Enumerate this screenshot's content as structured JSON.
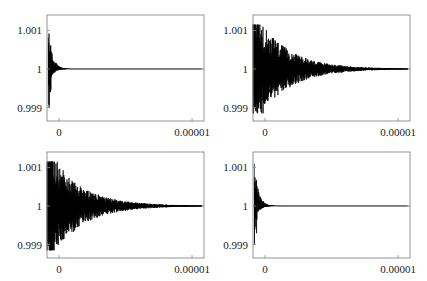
{
  "chart_data": [
    {
      "type": "line",
      "panel": "top-left",
      "title": "",
      "xlabel": "",
      "ylabel": "",
      "x_ticks": [
        "0",
        "0.00001"
      ],
      "y_ticks": [
        "1.001",
        "1",
        "0.999"
      ],
      "xlim": [
        0,
        1.18e-05
      ],
      "ylim": [
        0.99865,
        1.0014
      ],
      "reference_line": 1,
      "description": "Damped oscillation around 1; sharp spike to ~1.00115 near x=0, quickly decaying to 1 by ~0.000001",
      "envelope": {
        "initial_amplitude": 0.00115,
        "decay_x": 3e-07,
        "onset_x": 1e-07
      }
    },
    {
      "type": "line",
      "panel": "top-right",
      "title": "",
      "xlabel": "",
      "ylabel": "",
      "x_ticks": [
        "0",
        "0.00001"
      ],
      "y_ticks": [
        "1.001",
        "1",
        "0.999"
      ],
      "xlim": [
        0,
        1.18e-05
      ],
      "ylim": [
        0.99865,
        1.0014
      ],
      "reference_line": 1,
      "description": "Strongly oscillating signal clipped at ~1.00115 and ~0.99885 for x<0.000001, slowly decaying toward 1 by ~0.000011",
      "envelope": {
        "initial_amplitude": 0.0016,
        "decay_x": 2.2e-06,
        "onset_x": 0.0,
        "clip": [
          0.99885,
          1.00115
        ]
      }
    },
    {
      "type": "line",
      "panel": "bottom-left",
      "title": "",
      "xlabel": "",
      "ylabel": "",
      "x_ticks": [
        "0",
        "0.00001"
      ],
      "y_ticks": [
        "1.001",
        "1",
        "0.999"
      ],
      "xlim": [
        0,
        1.18e-05
      ],
      "ylim": [
        0.99865,
        1.0014
      ],
      "reference_line": 1,
      "description": "Strongly oscillating signal clipped at ~1.00115 and ~0.99885 for x<0.000001, slowly decaying toward 1 by ~0.000011",
      "envelope": {
        "initial_amplitude": 0.0016,
        "decay_x": 2.2e-06,
        "onset_x": 0.0,
        "clip": [
          0.99885,
          1.00115
        ]
      }
    },
    {
      "type": "line",
      "panel": "bottom-right",
      "title": "",
      "xlabel": "",
      "ylabel": "",
      "x_ticks": [
        "0",
        "0.00001"
      ],
      "y_ticks": [
        "1.001",
        "1",
        "0.999"
      ],
      "xlim": [
        0,
        1.18e-05
      ],
      "ylim": [
        0.99865,
        1.0014
      ],
      "reference_line": 1,
      "description": "Damped oscillation around 1; sharp spike to ~1.00115 near x=0, quickly decaying to 1 by ~0.000001",
      "envelope": {
        "initial_amplitude": 0.00115,
        "decay_x": 3e-07,
        "onset_x": 1e-07
      }
    }
  ],
  "panels": [
    {
      "id": "tl",
      "left": 0,
      "top": 0,
      "x_tick_labels": [
        "0",
        "0.00001"
      ],
      "y_tick_labels": [
        "1.001",
        "1",
        "0.999"
      ]
    },
    {
      "id": "tr",
      "left": 206,
      "top": 0,
      "x_tick_labels": [
        "0",
        "0.00001"
      ],
      "y_tick_labels": [
        "1.001",
        "1",
        "0.999"
      ]
    },
    {
      "id": "bl",
      "left": 0,
      "top": 137,
      "x_tick_labels": [
        "0",
        "0.00001"
      ],
      "y_tick_labels": [
        "1.001",
        "1",
        "0.999"
      ]
    },
    {
      "id": "br",
      "left": 206,
      "top": 137,
      "x_tick_labels": [
        "0",
        "0.00001"
      ],
      "y_tick_labels": [
        "1.001",
        "1",
        "0.999"
      ]
    }
  ],
  "colors": {
    "frame": "#888888",
    "signal": "#000000",
    "reference": "#555555",
    "text": "#222222"
  }
}
